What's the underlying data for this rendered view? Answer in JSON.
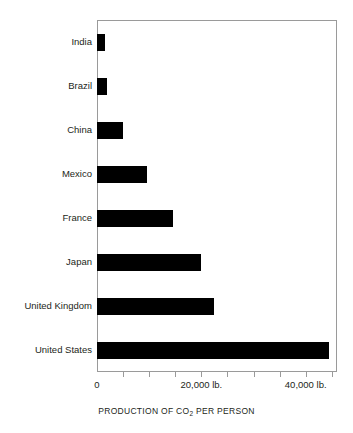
{
  "chart_data": {
    "type": "bar",
    "orientation": "horizontal",
    "title": "",
    "xlabel": "PRODUCTION OF CO2 PER PERSON",
    "xlabel_parts": {
      "before": "PRODUCTION OF CO",
      "sub": "2",
      "after": " PER PERSON"
    },
    "ylabel": "",
    "categories": [
      "India",
      "Brazil",
      "China",
      "Mexico",
      "France",
      "Japan",
      "United Kingdom",
      "United States"
    ],
    "values": [
      1500,
      2000,
      5000,
      9500,
      14500,
      20000,
      22500,
      44500
    ],
    "unit": "lb.",
    "xlim": [
      0,
      46000
    ],
    "xticks": [
      0,
      5000,
      10000,
      15000,
      20000,
      25000,
      30000,
      35000,
      40000,
      45000
    ],
    "xtick_labels": [
      "0",
      "",
      "",
      "",
      "20,000 lb.",
      "",
      "",
      "",
      "40,000 lb.",
      ""
    ],
    "visible_xtick_labels": [
      {
        "value": 0,
        "text": "0"
      },
      {
        "value": 20000,
        "text": "20,000 lb."
      },
      {
        "value": 40000,
        "text": "40,000 lb."
      }
    ],
    "grid": false,
    "legend": false,
    "bar_color": "#000000",
    "frame_color": "#9a9a9a",
    "background": "#ffffff"
  },
  "axis": {
    "x_title": "PRODUCTION OF CO",
    "x_title_sub": "2",
    "x_title_rest": " PER PERSON",
    "tick_0": "0",
    "tick_20000": "20,000 lb.",
    "tick_40000": "40,000 lb."
  },
  "categories": {
    "c0": "India",
    "c1": "Brazil",
    "c2": "China",
    "c3": "Mexico",
    "c4": "France",
    "c5": "Japan",
    "c6": "United Kingdom",
    "c7": "United States"
  }
}
